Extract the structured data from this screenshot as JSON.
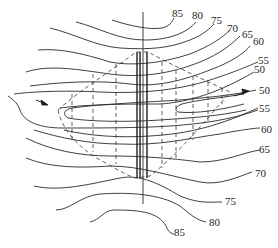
{
  "diagram": {
    "type": "contour-map",
    "contour_labels_top": [
      "85",
      "80",
      "75",
      "70",
      "65",
      "60",
      "55",
      "50"
    ],
    "contour_labels_right": [
      "50",
      "55",
      "60",
      "65",
      "70",
      "75",
      "80",
      "85"
    ],
    "labels": {
      "t85": "85",
      "t80": "80",
      "t75": "75",
      "t70": "70",
      "t65": "65",
      "t60": "60",
      "t55": "55",
      "t50": "50",
      "r50": "50",
      "r55": "55",
      "r60": "60",
      "r65": "65",
      "r70": "70",
      "r75": "75",
      "r80": "80",
      "r85": "85"
    },
    "arrows": [
      {
        "name": "inflow-arrow",
        "direction": "right",
        "position": "left"
      },
      {
        "name": "outflow-arrow",
        "direction": "right",
        "position": "right"
      }
    ],
    "colors": {
      "line": "#2a2a2a",
      "background": "#ffffff"
    }
  }
}
